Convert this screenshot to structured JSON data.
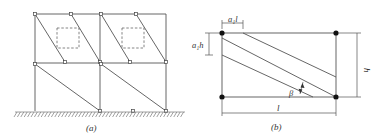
{
  "figure_a": {
    "caption": "(a)",
    "description": "Two-bay, two-storey frame with diagonal infill struts and dashed window openings in the upper storey",
    "bays": 2,
    "storeys": 2,
    "has_openings_upper_storey": true
  },
  "figure_b": {
    "caption": "(b)",
    "labels": {
      "top_offset": "a₁l",
      "left_offset": "a₁h",
      "height": "h",
      "length": "l",
      "angle": "β"
    }
  },
  "colors": {
    "line": "#444444",
    "node": "#111111",
    "background": "#ffffff"
  }
}
